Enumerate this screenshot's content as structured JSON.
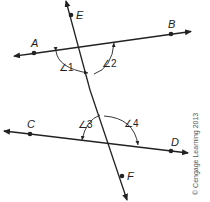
{
  "diagram": {
    "points": {
      "A": "A",
      "B": "B",
      "C": "C",
      "D": "D",
      "E": "E",
      "F": "F"
    },
    "angles": {
      "a1": "∠1",
      "a2": "∠2",
      "a3": "∠3",
      "a4": "∠4"
    },
    "lines": [
      "AB",
      "CD",
      "EF"
    ],
    "colors": {
      "stroke": "#222222",
      "background": "#ffffff"
    }
  },
  "copyright": "© Cengage Learning 2013"
}
